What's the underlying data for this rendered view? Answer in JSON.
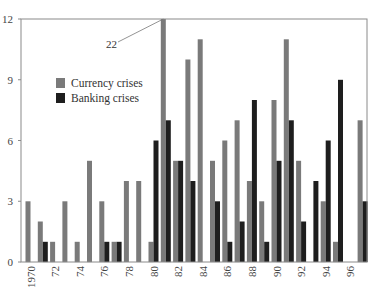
{
  "chart_data": {
    "type": "bar",
    "title": "",
    "xlabel": "",
    "ylabel": "",
    "ylim": [
      0,
      12
    ],
    "yticks": [
      0,
      3,
      6,
      9,
      12
    ],
    "x": [
      1970,
      1971,
      1972,
      1973,
      1974,
      1975,
      1976,
      1977,
      1978,
      1979,
      1980,
      1981,
      1982,
      1983,
      1984,
      1985,
      1986,
      1987,
      1988,
      1989,
      1990,
      1991,
      1992,
      1993,
      1994,
      1995,
      1996,
      1997
    ],
    "xtick_labels": [
      "1970",
      "72",
      "74",
      "76",
      "78",
      "80",
      "82",
      "84",
      "86",
      "88",
      "90",
      "92",
      "94",
      "96"
    ],
    "xtick_years": [
      1970,
      1972,
      1974,
      1976,
      1978,
      1980,
      1982,
      1984,
      1986,
      1988,
      1990,
      1992,
      1994,
      1996
    ],
    "series": [
      {
        "name": "Currency crises",
        "color": "#7a7a7a",
        "values": [
          3,
          2,
          1,
          3,
          1,
          5,
          3,
          1,
          4,
          4,
          1,
          22,
          5,
          10,
          11,
          5,
          6,
          7,
          4,
          3,
          8,
          11,
          5,
          0,
          3,
          1,
          0,
          7
        ]
      },
      {
        "name": "Banking crises",
        "color": "#1e1e1e",
        "values": [
          0,
          1,
          0,
          0,
          0,
          0,
          1,
          1,
          0,
          0,
          6,
          7,
          5,
          4,
          0,
          3,
          1,
          2,
          8,
          1,
          5,
          7,
          2,
          4,
          6,
          9,
          0,
          3
        ]
      }
    ],
    "annotations": [
      {
        "text": "22",
        "year": 1981,
        "series": "Currency crises",
        "note": "bar truncated at axis max 12"
      }
    ],
    "legend": {
      "position": "upper-left-inside",
      "entries": [
        "Currency crises",
        "Banking crises"
      ]
    },
    "grid": false
  }
}
